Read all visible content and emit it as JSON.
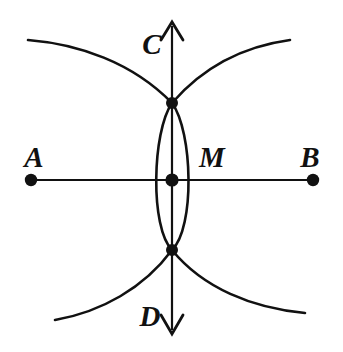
{
  "figure": {
    "background_color": "#ffffff",
    "ink_color": "#111111",
    "width": 343,
    "height": 352
  },
  "labels": {
    "a": "A",
    "b": "B",
    "c": "C",
    "d": "D",
    "m": "M"
  },
  "label_positions": {
    "a": {
      "x": 34,
      "y": 167
    },
    "b": {
      "x": 310,
      "y": 167
    },
    "c": {
      "x": 143,
      "y": 54
    },
    "d": {
      "x": 141,
      "y": 326
    },
    "m": {
      "x": 199,
      "y": 167
    }
  },
  "points": [
    {
      "name": "A",
      "x": 31,
      "y": 180,
      "radius": 6.2,
      "label": "A"
    },
    {
      "name": "B",
      "x": 313,
      "y": 180,
      "radius": 6.2,
      "label": "B"
    },
    {
      "name": "M",
      "x": 172,
      "y": 180,
      "radius": 6.6,
      "label": "M"
    },
    {
      "name": "upper-intersection",
      "x": 172,
      "y": 103,
      "radius": 6.0,
      "label": ""
    },
    {
      "name": "lower-intersection",
      "x": 172,
      "y": 250,
      "radius": 6.0,
      "label": ""
    }
  ],
  "segment_ab": {
    "name": "segment-AB",
    "x1": 31,
    "y1": 180,
    "x2": 313,
    "y2": 180
  },
  "line_cd": {
    "name": "line-CD",
    "x": 172,
    "y_top": 26,
    "y_bottom": 330,
    "arrow_top": {
      "tip_x": 172,
      "tip_y": 22,
      "left_x": 161,
      "left_y": 40,
      "right_x": 183,
      "right_y": 40
    },
    "arrow_bottom": {
      "tip_x": 172,
      "tip_y": 334,
      "left_x": 161,
      "left_y": 315,
      "right_x": 183,
      "right_y": 315
    }
  },
  "arcs": {
    "from_a_upper": {
      "path": "M 28,40 Q 120,50 172,103",
      "description": "long arc centered at A sweeping over the top"
    },
    "from_b_upper": {
      "path": "M 290,40 Q 216,52 172,103",
      "description": "long arc centered at B sweeping over the top"
    },
    "from_a_lower": {
      "path": "M 55,320 Q 128,300 172,250",
      "description": "long arc centered at A sweeping under the bottom"
    },
    "from_b_lower": {
      "path": "M 305,313 Q 220,300 172,250",
      "description": "long arc centered at B sweeping under the bottom"
    },
    "lens_left": {
      "path": "M 172,103 Q 149,180 172,250",
      "description": "left side of vesica lens"
    },
    "lens_right": {
      "path": "M 172,103 Q 195,180 172,250",
      "description": "right side of vesica lens"
    }
  }
}
